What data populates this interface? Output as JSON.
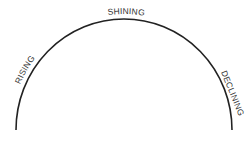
{
  "diagram": {
    "type": "semicircle-arc",
    "stroke_color": "#222222",
    "text_color": "#333333",
    "labels": {
      "left": "RISING",
      "top": "SHINING",
      "right": "DECLINING"
    }
  }
}
